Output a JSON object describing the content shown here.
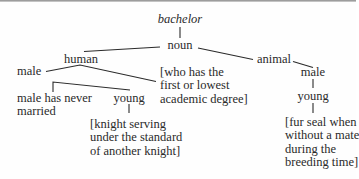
{
  "diagram": {
    "type": "semantic-tree",
    "root": "bachelor",
    "nodes": {
      "root": {
        "label": "bachelor",
        "style": "italic"
      },
      "noun": {
        "label": "noun"
      },
      "human": {
        "label": "human"
      },
      "animal": {
        "label": "animal"
      },
      "human_male": {
        "label": "male"
      },
      "animal_male": {
        "label": "male"
      },
      "human_degree": {
        "lines": [
          "[who has the",
          "first or lowest",
          "academic degree]"
        ]
      },
      "never_married": {
        "lines": [
          "male has never",
          "married"
        ]
      },
      "human_young": {
        "label": "young"
      },
      "knight": {
        "lines": [
          "[knight serving",
          "under the standard",
          "of another knight]"
        ]
      },
      "animal_young": {
        "label": "young"
      },
      "fur_seal": {
        "lines": [
          "[fur seal when",
          "without a mate",
          "during the",
          "breeding time]"
        ]
      }
    },
    "edges": [
      [
        "root",
        "noun"
      ],
      [
        "noun",
        "human"
      ],
      [
        "noun",
        "animal"
      ],
      [
        "human",
        "human_male"
      ],
      [
        "human",
        "human_degree"
      ],
      [
        "human_male",
        "never_married"
      ],
      [
        "human_male",
        "human_young"
      ],
      [
        "human_young",
        "knight"
      ],
      [
        "animal",
        "animal_male"
      ],
      [
        "animal_male",
        "animal_young"
      ],
      [
        "animal_young",
        "fur_seal"
      ]
    ],
    "colors": {
      "text": "#2a2a2a",
      "lines": "#2a2a2a",
      "background": "#fefefe"
    }
  }
}
